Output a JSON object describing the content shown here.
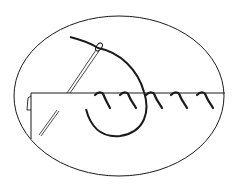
{
  "illustration": {
    "subject": "overcast-stitch",
    "colors": {
      "background": "#ffffff",
      "line": "#1a1a1a"
    },
    "stitch_count": 5
  }
}
